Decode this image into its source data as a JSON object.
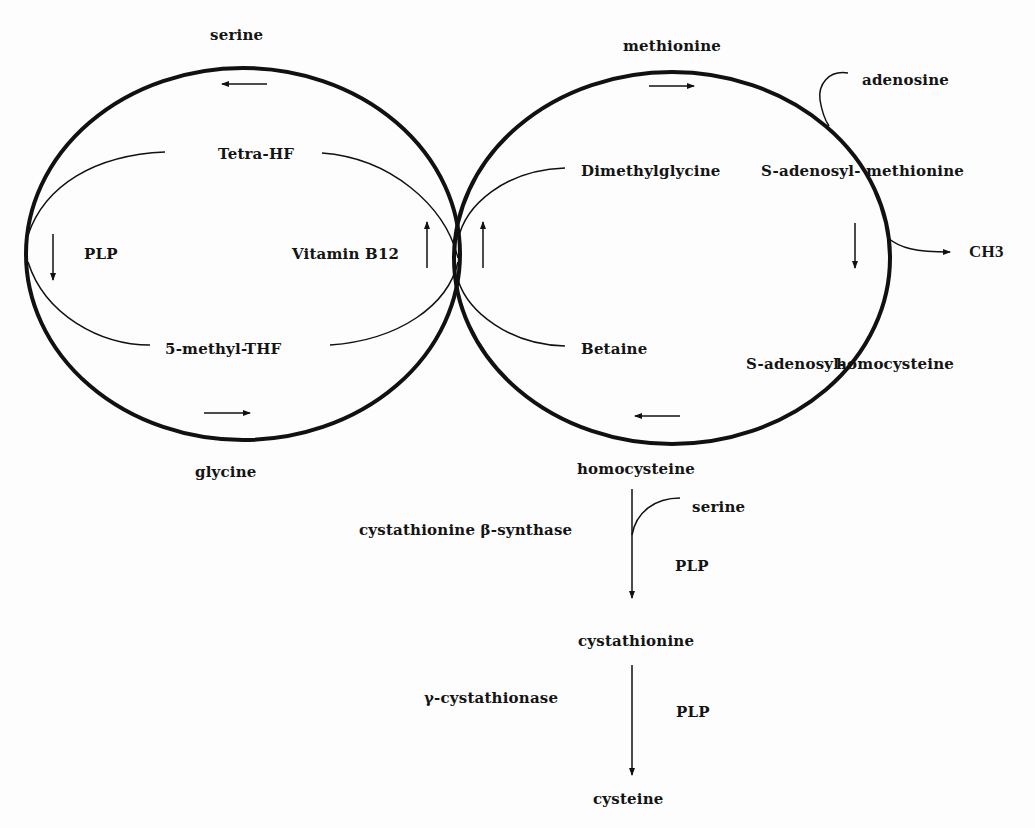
{
  "diagram": {
    "colors": {
      "ink": "#111111",
      "background": "#fdfdfd"
    },
    "folate_cycle": {
      "top_metabolite": "serine",
      "bottom_metabolite": "glycine",
      "upper_node": "Tetra-HF",
      "lower_node": "5-methyl-THF",
      "left_cofactor": "PLP",
      "right_cofactor": "Vitamin B12",
      "top_arrow": "left",
      "bottom_arrow": "right",
      "left_arrow": "down",
      "right_arrow": "up"
    },
    "methionine_cycle": {
      "top_metabolite": "methionine",
      "bottom_metabolite": "homocysteine",
      "upper_left_node": "Dimethylglycine",
      "lower_left_node": "Betaine",
      "sam_prefix": "S-adenosyl-",
      "sam_suffix": "methionine",
      "sah_prefix": "S-adenosyl-",
      "sah_suffix": "homocysteine",
      "input_branch": "adenosine",
      "output_branch": "CH3",
      "top_arrow": "right",
      "bottom_arrow": "left",
      "left_arrow": "up",
      "right_arrow": "down"
    },
    "transsulfuration": {
      "steps": [
        {
          "from": "homocysteine",
          "enzyme": "cystathionine β-synthase",
          "cosubstrate": "serine",
          "cofactor": "PLP",
          "to": "cystathionine"
        },
        {
          "from": "cystathionine",
          "enzyme": "γ-cystathionase",
          "cofactor": "PLP",
          "to": "cysteine"
        }
      ]
    }
  }
}
